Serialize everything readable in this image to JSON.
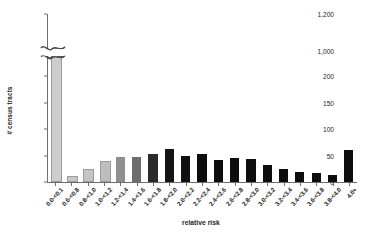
{
  "chart_data": {
    "type": "bar",
    "title": "",
    "xlabel": "relative risk",
    "ylabel": "# census tracts",
    "grid": false,
    "legend": "none",
    "y_axis": {
      "broken": true,
      "lower_ticks": [
        0,
        50,
        100,
        150,
        200
      ],
      "upper_ticks": [
        1000,
        1200
      ],
      "lower_range": [
        0,
        200
      ],
      "upper_range": [
        950,
        1200
      ],
      "tick_labels": [
        "0",
        "50",
        "100",
        "150",
        "200",
        "1,000",
        "1,200"
      ]
    },
    "categories": [
      "0.0-<0.1",
      "0.6-<0.8",
      "0.8-<1.0",
      "1.0-<1.2",
      "1.2-<1.4",
      "1.4-<1.6",
      "1.6-<1.8",
      "1.8-<2.0",
      "2.0-<2.2",
      "2.2-<2.4",
      "2.4-<2.6",
      "2.6-<2.8",
      "2.8-<3.0",
      "3.0-<3.2",
      "3.2-<3.4",
      "3.4-<3.6",
      "3.6-<3.8",
      "3.8-<4.0",
      "4.0+"
    ],
    "values": [
      990,
      8,
      20,
      35,
      47,
      47,
      53,
      63,
      50,
      52,
      42,
      46,
      43,
      32,
      24,
      18,
      17,
      14,
      60
    ],
    "bar_colors": [
      "#cdcdcd",
      "#c9c9c9",
      "#c4c4c4",
      "#bdbdbd",
      "#8f8f8f",
      "#6d6d6d",
      "#2a2a2a",
      "#151515",
      "#111111",
      "#0d0d0d",
      "#0d0d0d",
      "#0d0d0d",
      "#0d0d0d",
      "#0d0d0d",
      "#0d0d0d",
      "#0d0d0d",
      "#0d0d0d",
      "#0d0d0d",
      "#0d0d0d"
    ]
  }
}
